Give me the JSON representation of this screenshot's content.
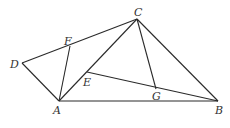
{
  "diagram": {
    "type": "geometry",
    "points": {
      "A": {
        "label": "A",
        "x": 59,
        "y": 101,
        "lx": 53,
        "ly": 114
      },
      "B": {
        "label": "B",
        "x": 218,
        "y": 101,
        "lx": 215,
        "ly": 114
      },
      "C": {
        "label": "C",
        "x": 137,
        "y": 19,
        "lx": 134,
        "ly": 16
      },
      "D": {
        "label": "D",
        "x": 22,
        "y": 63,
        "lx": 10,
        "ly": 68
      },
      "E": {
        "label": "E",
        "x": 87,
        "y": 72,
        "lx": 83,
        "ly": 86
      },
      "F": {
        "label": "F",
        "x": 70,
        "y": 46,
        "lx": 64,
        "ly": 45
      },
      "G": {
        "label": "G",
        "x": 156,
        "y": 89,
        "lx": 152,
        "ly": 100
      }
    },
    "segments": [
      [
        "D",
        "C"
      ],
      [
        "D",
        "A"
      ],
      [
        "A",
        "F"
      ],
      [
        "A",
        "C"
      ],
      [
        "A",
        "B"
      ],
      [
        "C",
        "B"
      ],
      [
        "C",
        "G"
      ],
      [
        "E",
        "B"
      ]
    ]
  }
}
